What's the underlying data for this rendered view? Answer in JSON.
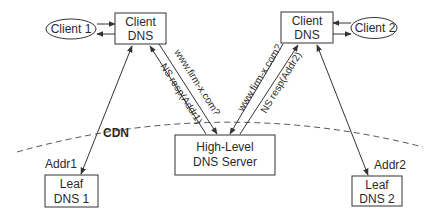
{
  "nodes": {
    "client1": {
      "label": "Client 1"
    },
    "client2": {
      "label": "Client 2"
    },
    "client_dns_left": {
      "line1": "Client",
      "line2": "DNS"
    },
    "client_dns_right": {
      "line1": "Client",
      "line2": "DNS"
    },
    "high_level": {
      "line1": "High-Level",
      "line2": "DNS Server"
    },
    "leaf1": {
      "line1": "Leaf",
      "line2": "DNS 1"
    },
    "leaf2": {
      "line1": "Leaf",
      "line2": "DNS 2"
    }
  },
  "edges": {
    "query_left": "www.firm-x.com?",
    "resp_left": "NS resp(Addr1)",
    "query_right": "www.firm-x.com?",
    "resp_right": "NS resp(Addr2)",
    "addr1": "Addr1",
    "addr2": "Addr2"
  },
  "region": {
    "label": "CDN"
  },
  "colors": {
    "stroke": "#333333",
    "dashed": "#555555",
    "text": "#2a2a2a"
  }
}
